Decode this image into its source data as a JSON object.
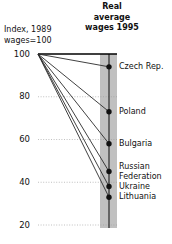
{
  "header": {
    "right_title": "Real\naverage\nwages\n1995",
    "axis_caption": "Index,\n1989 wages=100"
  },
  "chart_data": {
    "type": "line",
    "subtype": "slope",
    "title": "",
    "xlabel": "",
    "ylabel": "Index, 1989 wages=100",
    "x": [
      "1989",
      "1995"
    ],
    "ylim": [
      20,
      100
    ],
    "yticks": [
      100,
      80,
      60,
      40,
      20
    ],
    "ytick_labels": [
      "100",
      "80",
      "60",
      "40",
      "20"
    ],
    "grid": true,
    "legend": "right-labels",
    "baseline_value": 100,
    "series": [
      {
        "name": "Czech Rep.",
        "values": [
          100,
          94
        ]
      },
      {
        "name": "Poland",
        "values": [
          100,
          73
        ]
      },
      {
        "name": "Bulgaria",
        "values": [
          100,
          58
        ]
      },
      {
        "name": "Russian\nFederation",
        "values": [
          100,
          45
        ]
      },
      {
        "name": "Ukraine",
        "values": [
          100,
          38
        ]
      },
      {
        "name": "Lithuania",
        "values": [
          100,
          33
        ]
      }
    ]
  },
  "style": {
    "line_color": "#2b2b2b",
    "dot_color": "#111111",
    "band_color": "#9a9a9a",
    "band_line_color": "#1a1a1a",
    "grid_color": "#b0b0b0",
    "baseline_color": "#000000"
  }
}
